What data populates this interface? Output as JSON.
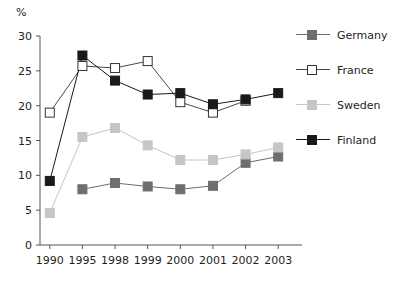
{
  "chart_data": {
    "type": "line",
    "title": "",
    "subtitle": "",
    "xlabel": "",
    "ylabel": "%",
    "ylim": [
      0,
      30
    ],
    "yticks": [
      0,
      5,
      10,
      15,
      20,
      25,
      30
    ],
    "grid": false,
    "legend_position": "right",
    "categories": [
      "1990",
      "1995",
      "1998",
      "1999",
      "2000",
      "2001",
      "2002",
      "2003"
    ],
    "series": [
      {
        "name": "Germany",
        "marker": "filled-square",
        "color": "#6e6e6e",
        "line_color": "#6e6e6e",
        "values": [
          null,
          8.0,
          8.9,
          8.4,
          8.0,
          8.5,
          11.8,
          12.7
        ]
      },
      {
        "name": "France",
        "marker": "open-square",
        "color": "#ffffff",
        "line_color": "#4a4a4a",
        "values": [
          19.0,
          25.7,
          25.4,
          26.4,
          20.5,
          19.0,
          20.7,
          null
        ]
      },
      {
        "name": "Sweden",
        "marker": "filled-square",
        "color": "#c6c6c6",
        "line_color": "#c6c6c6",
        "values": [
          4.6,
          15.5,
          16.8,
          14.3,
          12.2,
          12.2,
          13.0,
          14.0
        ]
      },
      {
        "name": "Finland",
        "marker": "filled-square",
        "color": "#1a1a1a",
        "line_color": "#1a1a1a",
        "values": [
          9.2,
          27.2,
          23.6,
          21.6,
          21.8,
          20.2,
          20.9,
          21.8
        ]
      }
    ]
  },
  "legend": {
    "items": [
      {
        "label": "Germany"
      },
      {
        "label": "France"
      },
      {
        "label": "Sweden"
      },
      {
        "label": "Finland"
      }
    ]
  },
  "axes": {
    "y_unit_label": "%"
  }
}
